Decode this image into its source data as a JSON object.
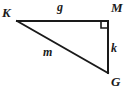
{
  "figure": {
    "type": "right-triangle-diagram",
    "canvas": {
      "width": 126,
      "height": 91,
      "background": "#ffffff"
    },
    "stroke": {
      "color": "#1a1a1a",
      "width": 2
    },
    "vertices": [
      {
        "id": "K",
        "label": "K",
        "x": 17,
        "y": 21
      },
      {
        "id": "M",
        "label": "M",
        "x": 108,
        "y": 21
      },
      {
        "id": "G",
        "label": "G",
        "x": 108,
        "y": 73
      }
    ],
    "sides": [
      {
        "id": "KM",
        "label": "g",
        "from": "K",
        "to": "M",
        "position": "top"
      },
      {
        "id": "MG",
        "label": "k",
        "from": "M",
        "to": "G",
        "position": "right"
      },
      {
        "id": "KG",
        "label": "m",
        "from": "K",
        "to": "G",
        "position": "hypotenuse"
      }
    ],
    "right_angle": {
      "at": "M",
      "marker": "square",
      "size": 7,
      "x": 101,
      "y": 21
    },
    "polygon_points": "17,21 108,21 108,73"
  }
}
